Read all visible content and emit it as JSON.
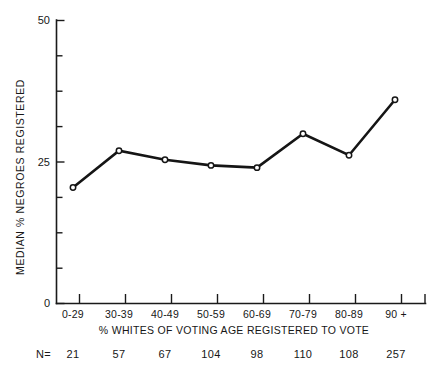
{
  "chart_data": {
    "type": "line",
    "title": "",
    "categories": [
      "0-29",
      "30-39",
      "40-49",
      "50-59",
      "60-69",
      "70-79",
      "80-89",
      "90 +"
    ],
    "values": [
      20.5,
      27.0,
      25.4,
      24.4,
      24.0,
      30.0,
      26.2,
      36.0
    ],
    "sample_sizes": [
      21,
      57,
      67,
      104,
      98,
      110,
      108,
      257
    ],
    "sample_label": "N=",
    "xlabel": "% WHITES OF VOTING AGE REGISTERED TO VOTE",
    "ylabel": "MEDIAN % NEGROES REGISTERED",
    "ylim": [
      0,
      50
    ],
    "ytick_labels": [
      "0",
      "25",
      "50"
    ],
    "ytick_values": [
      0,
      25,
      50
    ],
    "yminor_tick_values": [
      6.25,
      12.5,
      18.75,
      31.25,
      37.5,
      43.75
    ],
    "grid": false,
    "legend": null,
    "marker": "open-circle",
    "line_color": "#151515",
    "marker_fill": "#ffffff",
    "background": "#ffffff"
  },
  "axis": {
    "y_title": "MEDIAN % NEGROES REGISTERED",
    "x_title": "% WHITES OF VOTING AGE REGISTERED TO VOTE"
  }
}
